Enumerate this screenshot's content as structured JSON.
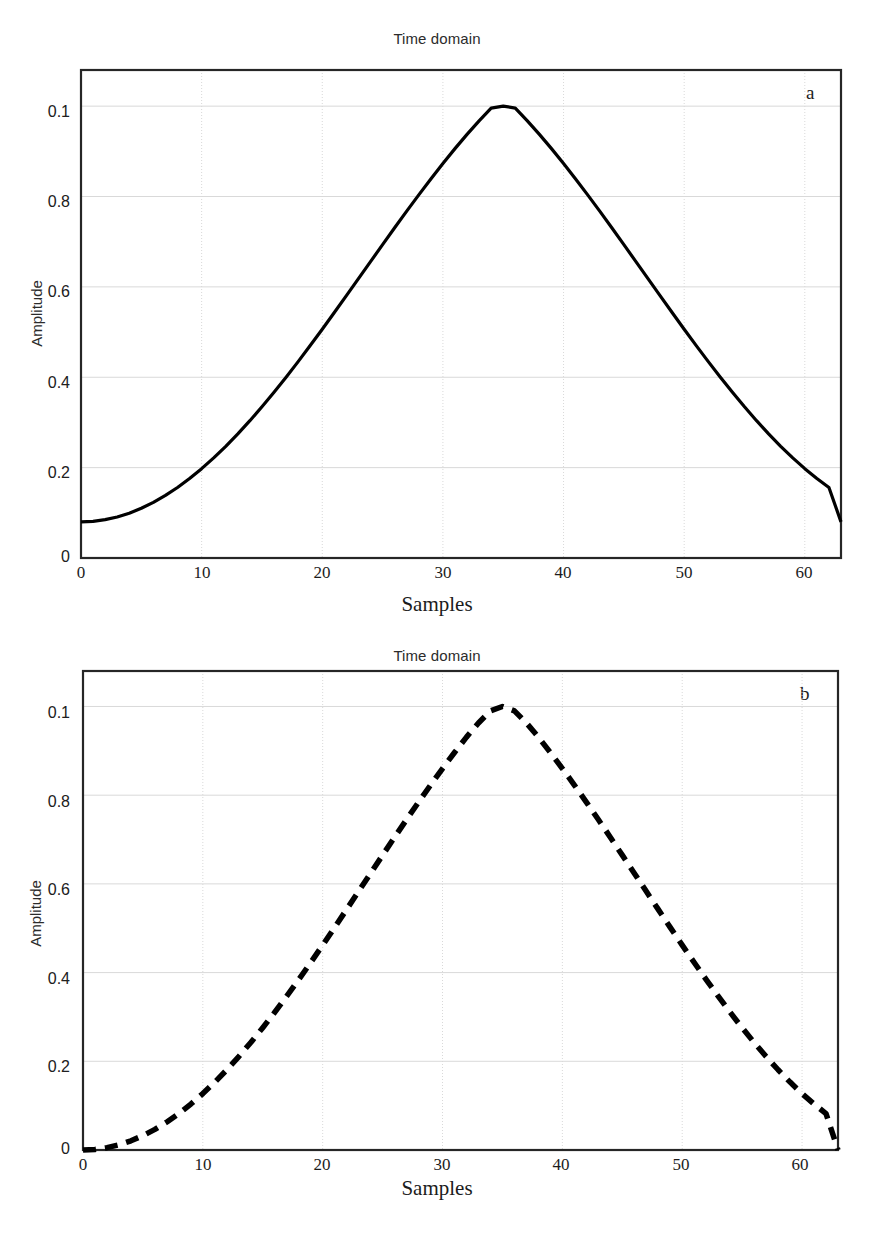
{
  "figure": {
    "width": 874,
    "height": 1235,
    "background": "#ffffff"
  },
  "chart_data": [
    {
      "type": "line",
      "panel_letter": "a",
      "title": "Time domain",
      "xlabel": "Samples",
      "ylabel": "Amplitude",
      "xlim": [
        0,
        63
      ],
      "ylim": [
        0,
        1.08
      ],
      "xticks": [
        "0",
        "10",
        "20",
        "30",
        "40",
        "50",
        "60"
      ],
      "xtick_values": [
        0,
        10,
        20,
        30,
        40,
        50,
        60
      ],
      "yticks": [
        "0",
        "0.2",
        "0.4",
        "0.6",
        "0.8",
        "0.1"
      ],
      "ytick_values": [
        0,
        0.2,
        0.4,
        0.6,
        0.8,
        1.0
      ],
      "grid": "both",
      "grid_color": "#d9d9d9",
      "line_color": "#000000",
      "line_style": "solid",
      "line_width": 3.2,
      "legend": "none",
      "series_name": "Hamming window",
      "description": "Hamming window, 64 samples: 0.54 - 0.46*cos(2*pi*n/63), endpoints at 0.08, peak 1.0 near sample 31.5",
      "x": [
        0,
        1,
        2,
        3,
        4,
        5,
        6,
        7,
        8,
        9,
        10,
        11,
        12,
        13,
        14,
        15,
        16,
        17,
        18,
        19,
        20,
        21,
        22,
        23,
        24,
        25,
        26,
        27,
        28,
        29,
        30,
        31,
        32,
        33,
        34,
        35,
        36,
        37,
        38,
        39,
        40,
        41,
        42,
        43,
        44,
        45,
        46,
        47,
        48,
        49,
        50,
        51,
        52,
        53,
        54,
        55,
        56,
        57,
        58,
        59,
        60,
        61,
        62,
        63
      ],
      "values": [
        0.08,
        0.0812,
        0.0848,
        0.0908,
        0.0992,
        0.11,
        0.1231,
        0.1385,
        0.1561,
        0.1759,
        0.1977,
        0.2215,
        0.2472,
        0.2747,
        0.3039,
        0.3346,
        0.3667,
        0.4001,
        0.4346,
        0.4701,
        0.5063,
        0.5432,
        0.5806,
        0.6182,
        0.6559,
        0.6935,
        0.7308,
        0.7676,
        0.8037,
        0.8389,
        0.8731,
        0.906,
        0.9375,
        0.9675,
        0.9957,
        1.0,
        0.9957,
        0.9675,
        0.9375,
        0.906,
        0.8731,
        0.8389,
        0.8037,
        0.7676,
        0.7308,
        0.6935,
        0.6559,
        0.6182,
        0.5806,
        0.5432,
        0.5063,
        0.4701,
        0.4346,
        0.4001,
        0.3667,
        0.3346,
        0.3039,
        0.2747,
        0.2472,
        0.2215,
        0.1977,
        0.1759,
        0.1561,
        0.08
      ]
    },
    {
      "type": "line",
      "panel_letter": "b",
      "title": "Time domain",
      "xlabel": "Samples",
      "ylabel": "Amplitude",
      "xlim": [
        0,
        63
      ],
      "ylim": [
        0,
        1.08
      ],
      "xticks": [
        "0",
        "10",
        "20",
        "30",
        "40",
        "50",
        "60"
      ],
      "xtick_values": [
        0,
        10,
        20,
        30,
        40,
        50,
        60
      ],
      "yticks": [
        "0",
        "0.2",
        "0.4",
        "0.6",
        "0.8",
        "0.1"
      ],
      "ytick_values": [
        0,
        0.2,
        0.4,
        0.6,
        0.8,
        1.0
      ],
      "grid": "both",
      "grid_color": "#d9d9d9",
      "line_color": "#000000",
      "line_style": "dashed",
      "line_width": 5.5,
      "dash_pattern": "13 9",
      "legend": "none",
      "series_name": "Hann window",
      "description": "Hann window, 64 samples: 0.5 - 0.5*cos(2*pi*n/63), endpoints at 0, peak 1.0 near sample 31.5",
      "x": [
        0,
        1,
        2,
        3,
        4,
        5,
        6,
        7,
        8,
        9,
        10,
        11,
        12,
        13,
        14,
        15,
        16,
        17,
        18,
        19,
        20,
        21,
        22,
        23,
        24,
        25,
        26,
        27,
        28,
        29,
        30,
        31,
        32,
        33,
        34,
        35,
        36,
        37,
        38,
        39,
        40,
        41,
        42,
        43,
        44,
        45,
        46,
        47,
        48,
        49,
        50,
        51,
        52,
        53,
        54,
        55,
        56,
        57,
        58,
        59,
        60,
        61,
        62,
        63
      ],
      "values": [
        0.0,
        0.0013,
        0.0052,
        0.0117,
        0.0208,
        0.0324,
        0.0465,
        0.0631,
        0.0822,
        0.1036,
        0.1272,
        0.1531,
        0.1809,
        0.2107,
        0.2424,
        0.2757,
        0.3105,
        0.3468,
        0.3842,
        0.4227,
        0.462,
        0.502,
        0.5425,
        0.5833,
        0.6241,
        0.6648,
        0.7052,
        0.7452,
        0.7844,
        0.8228,
        0.8601,
        0.8962,
        0.9309,
        0.9629,
        0.99,
        1.0,
        0.99,
        0.9629,
        0.9309,
        0.8962,
        0.8601,
        0.8228,
        0.7844,
        0.7452,
        0.7052,
        0.6648,
        0.6241,
        0.5833,
        0.5425,
        0.502,
        0.462,
        0.4227,
        0.3842,
        0.3468,
        0.3105,
        0.2757,
        0.2424,
        0.2107,
        0.1809,
        0.1531,
        0.1272,
        0.1036,
        0.0822,
        0.0
      ]
    }
  ]
}
